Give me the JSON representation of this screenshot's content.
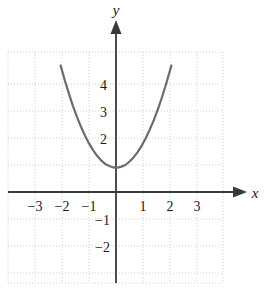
{
  "figure": {
    "title": "",
    "axis_labels": {
      "x": "x",
      "y": "y"
    },
    "x_ticks": [
      {
        "value": -3,
        "label": "−3"
      },
      {
        "value": -2,
        "label": "−2"
      },
      {
        "value": -1,
        "label": "−1"
      },
      {
        "value": 1,
        "label": "1"
      },
      {
        "value": 2,
        "label": "2"
      },
      {
        "value": 3,
        "label": "3"
      }
    ],
    "y_ticks": [
      {
        "value": 4,
        "label": "4"
      },
      {
        "value": 3,
        "label": "3"
      },
      {
        "value": 2,
        "label": "2"
      },
      {
        "value": -1,
        "label": "−1"
      },
      {
        "value": -2,
        "label": "−2"
      }
    ],
    "colors": {
      "curve": "#6b6b6b",
      "axis": "#3a3a3a",
      "grid": "#cfcfcf",
      "text": "#1a1a1a",
      "background": "#ffffff"
    }
  },
  "chart_data": {
    "type": "line",
    "title": "",
    "xlabel": "x",
    "ylabel": "y",
    "xlim": [
      -4,
      4
    ],
    "ylim": [
      -2.9,
      5.1
    ],
    "grid": true,
    "legend": null,
    "xticks": [
      -3,
      -2,
      -1,
      1,
      2,
      3
    ],
    "yticks": [
      4,
      3,
      2,
      -1,
      -2
    ],
    "series": [
      {
        "name": "parabola",
        "equation": "y = 0.9x^2 + 0.9",
        "vertex": [
          0,
          0.9
        ],
        "color": "#6b6b6b",
        "x": [
          -2.05,
          -1.9,
          -1.75,
          -1.6,
          -1.45,
          -1.3,
          -1.15,
          -1.0,
          -0.85,
          -0.7,
          -0.55,
          -0.4,
          -0.25,
          -0.1,
          0.05,
          0.2,
          0.35,
          0.5,
          0.65,
          0.8,
          0.95,
          1.1,
          1.25,
          1.4,
          1.55,
          1.7,
          1.85,
          2.0,
          2.05
        ],
        "y": [
          4.68,
          4.15,
          3.66,
          3.2,
          2.79,
          2.42,
          2.09,
          1.8,
          1.55,
          1.34,
          1.17,
          1.04,
          0.96,
          0.91,
          0.9,
          0.94,
          1.0,
          1.13,
          1.28,
          1.48,
          1.71,
          1.99,
          2.31,
          2.66,
          3.06,
          3.5,
          3.98,
          4.5,
          4.68
        ]
      }
    ]
  }
}
